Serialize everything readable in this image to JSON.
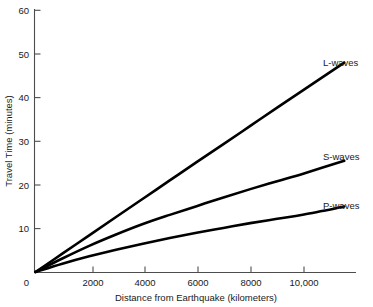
{
  "chart_data": {
    "type": "line",
    "title": "",
    "subtitle": "",
    "xlabel": "Distance from Earthquake (kilometers)",
    "ylabel": "Travel Time (minutes)",
    "xlim": [
      0,
      11600
    ],
    "ylim": [
      0,
      60
    ],
    "grid": false,
    "legend_position": "right-inline-labels",
    "xticks": [
      0,
      2000,
      4000,
      6000,
      8000,
      10000
    ],
    "xticklabels": [
      "0",
      "2000",
      "4000",
      "6000",
      "8000",
      "10,000"
    ],
    "yticks": [
      0,
      10,
      20,
      30,
      40,
      50,
      60
    ],
    "yticklabels": [
      "0",
      "10",
      "20",
      "30",
      "40",
      "50",
      "60"
    ],
    "x": [
      0,
      1000,
      2000,
      3000,
      4000,
      5000,
      6000,
      7000,
      8000,
      9000,
      10000,
      11500
    ],
    "series": [
      {
        "name": "L-waves",
        "label": "L-waves",
        "color": "#000000",
        "values": [
          0,
          4.2,
          8.4,
          12.6,
          16.8,
          21.0,
          25.2,
          29.3,
          33.5,
          37.7,
          41.8,
          48.0
        ]
      },
      {
        "name": "S-waves",
        "label": "S-waves",
        "color": "#000000",
        "values": [
          0,
          3.1,
          6.0,
          8.6,
          11.0,
          13.1,
          15.1,
          17.1,
          19.0,
          20.8,
          22.6,
          25.5
        ]
      },
      {
        "name": "P-waves",
        "label": "P-waves",
        "color": "#000000",
        "values": [
          0,
          1.9,
          3.6,
          5.1,
          6.5,
          7.8,
          9.0,
          10.1,
          11.2,
          12.2,
          13.2,
          15.0
        ]
      }
    ],
    "annotations": [
      {
        "text": "L-waves",
        "x": 11500,
        "y": 48.0
      },
      {
        "text": "S-waves",
        "x": 11500,
        "y": 25.5
      },
      {
        "text": "P-waves",
        "x": 11500,
        "y": 15.0
      }
    ]
  },
  "labels": {
    "xaxis_title": "Distance from Earthquake (kilometers)",
    "yaxis_title": "Travel Time (minutes)",
    "series_l": "L-waves",
    "series_s": "S-waves",
    "series_p": "P-waves",
    "ytick_0": "0",
    "ytick_10": "10",
    "ytick_20": "20",
    "ytick_30": "30",
    "ytick_40": "40",
    "ytick_50": "50",
    "ytick_60": "60",
    "xtick_0": "0",
    "xtick_2000": "2000",
    "xtick_4000": "4000",
    "xtick_6000": "6000",
    "xtick_8000": "8000",
    "xtick_10000": "10,000"
  },
  "colors": {
    "curve": "#000000",
    "axis": "#4d4d4d",
    "text": "#1a1a1a",
    "background": "#ffffff"
  }
}
